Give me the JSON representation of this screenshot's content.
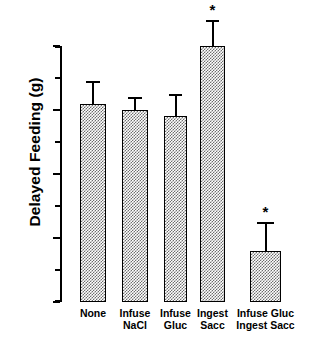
{
  "chart_data": {
    "type": "bar",
    "title": "",
    "xlabel": "",
    "ylabel": "Delayed Feeding (g)",
    "ylim": [
      0.0,
      4.0
    ],
    "ytick_labels": [
      "0.0",
      "1.0",
      "2.0",
      "3.0",
      "4.0"
    ],
    "ytick_values": [
      0.0,
      1.0,
      2.0,
      3.0,
      4.0
    ],
    "yminor_values": [
      0.5,
      1.5,
      2.5,
      3.5
    ],
    "grid": false,
    "legend": "none",
    "categories": [
      {
        "line1": "None",
        "line2": ""
      },
      {
        "line1": "Infuse",
        "line2": "NaCl"
      },
      {
        "line1": "Infuse",
        "line2": "Gluc"
      },
      {
        "line1": "Ingest",
        "line2": "Sacc"
      },
      {
        "line1": "Infuse Gluc",
        "line2": "Ingest Sacc"
      }
    ],
    "values": [
      3.1,
      3.0,
      2.9,
      4.0,
      0.8
    ],
    "errors": [
      0.35,
      0.2,
      0.35,
      0.4,
      0.45
    ],
    "significance": [
      "",
      "",
      "",
      "*",
      "*"
    ],
    "bar_fill": "#ffffff",
    "bar_pattern": "fine-checker",
    "bar_edge_color": "#000000",
    "axis_color": "#000000",
    "background": "#ffffff"
  },
  "annotations": {
    "significance_marker": "*"
  }
}
